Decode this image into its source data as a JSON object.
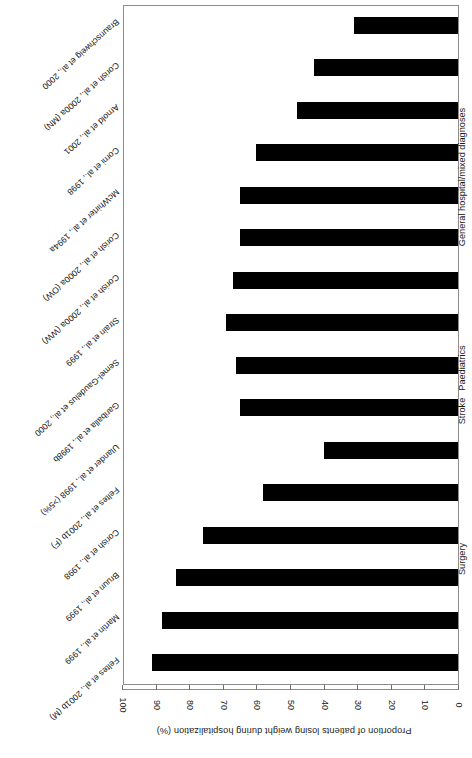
{
  "chart_data": {
    "type": "bar",
    "orientation": "horizontal",
    "title": "",
    "xlabel": "Proportion of patients losing weight during hospitalization (%)",
    "ylabel": "",
    "xlim": [
      0,
      100
    ],
    "xticks": [
      0,
      10,
      20,
      30,
      40,
      50,
      60,
      70,
      80,
      90,
      100
    ],
    "grid": false,
    "legend": false,
    "bar_color": "#000000",
    "frame_color": "#8d8d8d",
    "categories": [
      "Feltes et al., 2001b (M)",
      "Martin et al., 1999",
      "Bruun et al., 1999",
      "Corish et al., 1998",
      "Feltes et al., 2001b (F)",
      "Ulander et al., 1998 (>5%)",
      "Gariballa et al., 1998b",
      "Semel-Gaudelus et al., 2000",
      "Strain et al., 1999",
      "Corish et al., 2000a (WW)",
      "Corish et al., 2000a (OW)",
      "McWhirter et al., 1994a",
      "Corni et al., 1998",
      "Arnold et al., 2001",
      "Corish et al., 2000a (MN)",
      "Braunschweig et al., 2000"
    ],
    "values": [
      91,
      88,
      84,
      76,
      58,
      40,
      65,
      66,
      69,
      67,
      65,
      65,
      60,
      48,
      43,
      31
    ],
    "groups": [
      {
        "label": "Surgery",
        "start": 0,
        "end": 5
      },
      {
        "label": "Stroke",
        "start": 6,
        "end": 6
      },
      {
        "label": "Paediatrics",
        "start": 7,
        "end": 7
      },
      {
        "label": "General hospital/mixed diagnoses",
        "start": 8,
        "end": 15
      }
    ]
  },
  "axis": {
    "title": "Proportion of patients losing weight during hospitalization (%)",
    "tick_labels": [
      "0",
      "10",
      "20",
      "30",
      "40",
      "50",
      "60",
      "70",
      "80",
      "90",
      "100"
    ]
  },
  "groups": {
    "surgery": "Surgery",
    "stroke": "Stroke",
    "paediatrics": "Paediatrics",
    "general": "General hospital/mixed diagnoses"
  }
}
